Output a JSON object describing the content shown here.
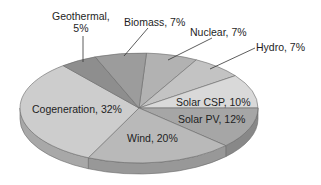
{
  "chart_data": {
    "type": "pie",
    "style": "3d",
    "title": "",
    "slices": [
      {
        "label": "Nuclear",
        "value": 7,
        "color": "#b2b2b2",
        "display": "Nuclear, 7%"
      },
      {
        "label": "Hydro",
        "value": 7,
        "color": "#c3c3c3",
        "display": "Hydro, 7%"
      },
      {
        "label": "Solar CSP",
        "value": 10,
        "color": "#d9d9d9",
        "display": "Solar CSP, 10%"
      },
      {
        "label": "Solar PV",
        "value": 12,
        "color": "#a6a6a6",
        "display": "Solar PV, 12%"
      },
      {
        "label": "Wind",
        "value": 20,
        "color": "#b9b9b9",
        "display": "Wind, 20%"
      },
      {
        "label": "Cogeneration",
        "value": 32,
        "color": "#cdcdcd",
        "display": "Cogeneration, 32%"
      },
      {
        "label": "Geothermal",
        "value": 5,
        "color": "#8e8e8e",
        "display": "Geothermal,\n5%"
      },
      {
        "label": "Biomass",
        "value": 7,
        "color": "#9c9c9c",
        "display": "Biomass, 7%"
      }
    ],
    "start_angle_deg": 3.6,
    "legend": "none",
    "labels": "data labels with leader lines for small top slices"
  },
  "labels": {
    "geothermal_line1": "Geothermal,",
    "geothermal_line2": "5%",
    "biomass": "Biomass, 7%",
    "nuclear": "Nuclear, 7%",
    "hydro": "Hydro, 7%",
    "solar_csp": "Solar CSP, 10%",
    "solar_pv": "Solar PV, 12%",
    "wind": "Wind, 20%",
    "cogeneration": "Cogeneration, 32%"
  }
}
